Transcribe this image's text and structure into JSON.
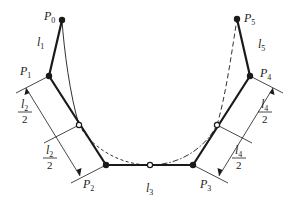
{
  "diagram": {
    "title": "",
    "points": [
      {
        "id": "P0",
        "label": "P",
        "sub": "0",
        "x": 62,
        "y": 20,
        "lx": 44,
        "ly": 20
      },
      {
        "id": "P1",
        "label": "P",
        "sub": "1",
        "x": 49,
        "y": 76,
        "lx": 20,
        "ly": 75
      },
      {
        "id": "P2",
        "label": "P",
        "sub": "2",
        "x": 106,
        "y": 165,
        "lx": 83,
        "ly": 188
      },
      {
        "id": "P3",
        "label": "P",
        "sub": "3",
        "x": 193,
        "y": 165,
        "lx": 200,
        "ly": 188
      },
      {
        "id": "P4",
        "label": "P",
        "sub": "4",
        "x": 250,
        "y": 76,
        "lx": 260,
        "ly": 77
      },
      {
        "id": "P5",
        "label": "P",
        "sub": "5",
        "x": 237,
        "y": 19,
        "lx": 244,
        "ly": 22
      }
    ],
    "midpoints": [
      {
        "id": "M12",
        "x": 79,
        "y": 125
      },
      {
        "id": "M23",
        "x": 150,
        "y": 165
      },
      {
        "id": "M34",
        "x": 217,
        "y": 125
      }
    ],
    "segment_labels": [
      {
        "id": "l1",
        "label": "l",
        "sub": "1",
        "x": 37,
        "y": 46
      },
      {
        "id": "l3",
        "label": "l",
        "sub": "3",
        "x": 146,
        "y": 192
      },
      {
        "id": "l5",
        "label": "l",
        "sub": "5",
        "x": 258,
        "y": 48
      }
    ],
    "fraction_labels": [
      {
        "id": "f2a",
        "num": "l",
        "num_sub": "2",
        "den": "2",
        "x": 24,
        "y": 112
      },
      {
        "id": "f2b",
        "num": "l",
        "num_sub": "2",
        "den": "2",
        "x": 49,
        "y": 158
      },
      {
        "id": "f4a",
        "num": "l",
        "num_sub": "4",
        "den": "2",
        "x": 264,
        "y": 112
      },
      {
        "id": "f4b",
        "num": "l",
        "num_sub": "4",
        "den": "2",
        "x": 238,
        "y": 158
      }
    ],
    "colors": {
      "line": "#1a1a1a",
      "background": "#ffffff"
    }
  }
}
